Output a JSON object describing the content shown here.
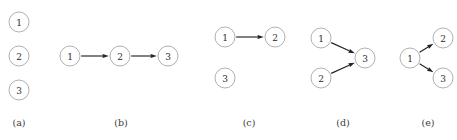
{
  "figure": {
    "width": 457,
    "height": 140,
    "background_color": "#ffffff",
    "node_stroke_color": "#a8a8a8",
    "node_fill_color": "#ffffff",
    "edge_color": "#222222",
    "label_color": "#2b2b2b",
    "caption_color": "#3a3a3a",
    "node_radius": 10
  },
  "panels": [
    {
      "id": "a",
      "caption": "(a)",
      "caption_x": 19,
      "description": "three isolated nodes, no edges",
      "nodes": [
        {
          "id": "1",
          "label": "1",
          "cx": 19,
          "cy": 22
        },
        {
          "id": "2",
          "label": "2",
          "cx": 19,
          "cy": 56
        },
        {
          "id": "3",
          "label": "3",
          "cx": 19,
          "cy": 90
        }
      ],
      "edges": []
    },
    {
      "id": "b",
      "caption": "(b)",
      "caption_x": 121,
      "description": "directed chain 1 to 2 to 3",
      "nodes": [
        {
          "id": "1",
          "label": "1",
          "cx": 70,
          "cy": 56
        },
        {
          "id": "2",
          "label": "2",
          "cx": 120,
          "cy": 56
        },
        {
          "id": "3",
          "label": "3",
          "cx": 168,
          "cy": 56
        }
      ],
      "edges": [
        {
          "from": "1",
          "to": "2"
        },
        {
          "from": "2",
          "to": "3"
        }
      ]
    },
    {
      "id": "c",
      "caption": "(c)",
      "caption_x": 249,
      "description": "single edge 1 to 2, node 3 isolated",
      "nodes": [
        {
          "id": "1",
          "label": "1",
          "cx": 225,
          "cy": 37
        },
        {
          "id": "2",
          "label": "2",
          "cx": 275,
          "cy": 37
        },
        {
          "id": "3",
          "label": "3",
          "cx": 225,
          "cy": 78
        }
      ],
      "edges": [
        {
          "from": "1",
          "to": "2"
        }
      ]
    },
    {
      "id": "d",
      "caption": "(d)",
      "caption_x": 343,
      "description": "converging collider, 1 to 3 and 2 to 3",
      "nodes": [
        {
          "id": "1",
          "label": "1",
          "cx": 321,
          "cy": 38
        },
        {
          "id": "2",
          "label": "2",
          "cx": 321,
          "cy": 78
        },
        {
          "id": "3",
          "label": "3",
          "cx": 365,
          "cy": 58
        }
      ],
      "edges": [
        {
          "from": "1",
          "to": "3"
        },
        {
          "from": "2",
          "to": "3"
        }
      ]
    },
    {
      "id": "e",
      "caption": "(e)",
      "caption_x": 428,
      "description": "diverging fork, 1 to 2 and 1 to 3",
      "nodes": [
        {
          "id": "1",
          "label": "1",
          "cx": 410,
          "cy": 58
        },
        {
          "id": "2",
          "label": "2",
          "cx": 443,
          "cy": 38
        },
        {
          "id": "3",
          "label": "3",
          "cx": 443,
          "cy": 78
        }
      ],
      "edges": [
        {
          "from": "1",
          "to": "2"
        },
        {
          "from": "1",
          "to": "3"
        }
      ]
    }
  ]
}
